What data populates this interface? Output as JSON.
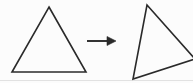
{
  "figure": {
    "name": "triangle-rotation-figure",
    "caption": "",
    "alt_text": "An upright triangle, an arrow pointing right, and the same triangle rotated.",
    "width": 193,
    "height": 83,
    "background_color": "#fcfcfc",
    "ink_color": "#2a2a2a",
    "artifact_color": "#dedede",
    "stroke_width": 1.6
  },
  "shapes": {
    "left_triangle": {
      "label": "",
      "name": "upright-triangle",
      "stroke_color": "#2a2a2a",
      "fill": "none",
      "points": "49,7 86,72 12,72",
      "vertices": [
        {
          "id": "apex",
          "x": 49,
          "y": 7
        },
        {
          "id": "bottom-right",
          "x": 86,
          "y": 72
        },
        {
          "id": "bottom-left",
          "x": 12,
          "y": 72
        }
      ]
    },
    "right_triangle": {
      "label": "",
      "name": "rotated-triangle",
      "stroke_color": "#2a2a2a",
      "fill": "none",
      "points": "147,5 195,59 133,79",
      "vertices": [
        {
          "id": "apex",
          "x": 147,
          "y": 5
        },
        {
          "id": "right",
          "x": 195,
          "y": 59
        },
        {
          "id": "bottom-left",
          "x": 133,
          "y": 79
        }
      ],
      "clipped_at_right_edge": true
    },
    "arrow": {
      "label": "",
      "name": "right-arrow",
      "stroke_color": "#2a2a2a",
      "shaft": {
        "x1": 87,
        "y1": 41,
        "x2": 110,
        "y2": 41
      },
      "head_points": "116,41 107,36.5 107,45.5"
    },
    "scan_artifact_line": {
      "name": "scan-artifact-line",
      "stroke_color": "#e2e2e2",
      "x1": 0,
      "y1": 80.5,
      "x2": 193,
      "y2": 80.5
    }
  }
}
